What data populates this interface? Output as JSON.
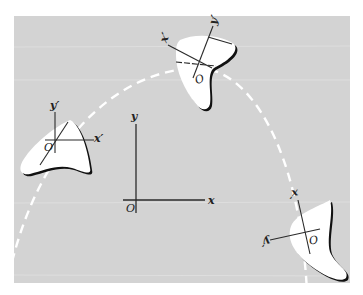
{
  "figure": {
    "colors": {
      "panel": "#d3d3d3",
      "blob_fill": "#ffffff",
      "blob_shadow": "#111111",
      "axis": "#2a2a2a",
      "path": "#ffffff"
    },
    "fixed_frame": {
      "origin_label": "O",
      "x_label": "x",
      "y_label": "y"
    },
    "body_left": {
      "origin_label": "O",
      "x_label": "x′",
      "y_label": "y′"
    },
    "body_top": {
      "origin_label": "O",
      "x_label": "x′",
      "y_label": "y′"
    },
    "body_bottom_right": {
      "origin_label": "O",
      "x_label": "x′",
      "y_label": "y′"
    }
  }
}
